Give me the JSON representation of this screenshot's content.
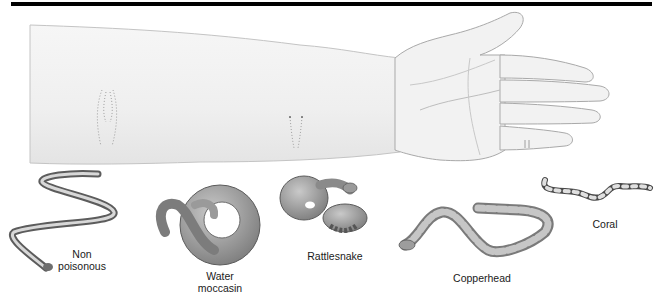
{
  "figure": {
    "arm": {
      "bite_marks": [
        {
          "name": "nonpoisonous-bite",
          "pattern": "two U-shaped rows of small tooth marks"
        },
        {
          "name": "poisonous-bite",
          "pattern": "two fang punctures with faint tooth rows"
        },
        {
          "name": "coral-bite",
          "pattern": "small chewing marks on finger"
        }
      ]
    },
    "snakes": [
      {
        "id": "nonpoisonous",
        "label_lines": [
          "Non",
          "poisonous"
        ]
      },
      {
        "id": "water-moccasin",
        "label_lines": [
          "Water",
          "moccasin"
        ]
      },
      {
        "id": "rattlesnake",
        "label_lines": [
          "Rattlesnake"
        ]
      },
      {
        "id": "copperhead",
        "label_lines": [
          "Copperhead"
        ]
      },
      {
        "id": "coral",
        "label_lines": [
          "Coral"
        ]
      }
    ]
  },
  "colors": {
    "rule": "#000000",
    "skin_fill": "#f3f3f3",
    "skin_outline": "#b5b5b5",
    "snake_dark": "#6e6e6e",
    "snake_mid": "#9a9a9a",
    "snake_light": "#cfcfcf",
    "label_text": "#1a1a1a"
  }
}
